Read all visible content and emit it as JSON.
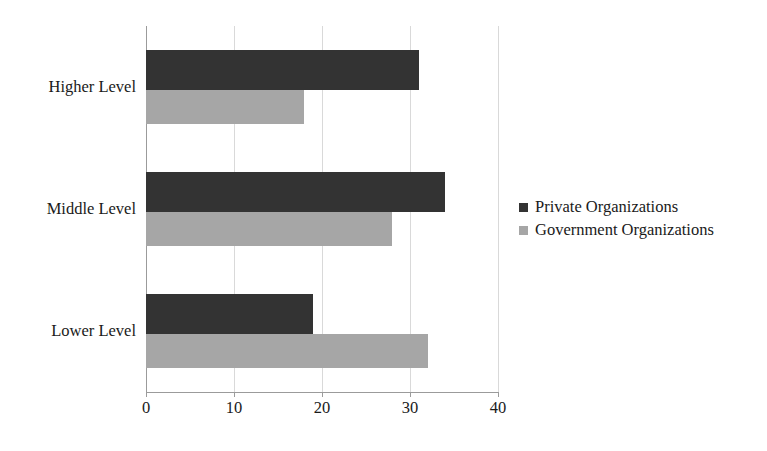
{
  "chart_data": {
    "type": "bar",
    "orientation": "horizontal",
    "title": "",
    "xlabel": "",
    "ylabel": "",
    "xlim": [
      0,
      40
    ],
    "xticks": [
      "0",
      "10",
      "20",
      "30",
      "40"
    ],
    "xtick_values": [
      0,
      10,
      20,
      30,
      40
    ],
    "grid": "vertical",
    "legend_position": "right",
    "categories": [
      "Higher Level",
      "Middle Level",
      "Lower Level"
    ],
    "series": [
      {
        "name": "Private Organizations",
        "color": "#333333",
        "values": [
          31,
          34,
          19
        ]
      },
      {
        "name": "Government Organizations",
        "color": "#a6a6a6",
        "values": [
          18,
          28,
          32
        ]
      }
    ]
  },
  "legend": {
    "items": [
      {
        "label": "Private Organizations",
        "swatch": "legend-swatch-private"
      },
      {
        "label": "Government Organizations",
        "swatch": "legend-swatch-government"
      }
    ]
  },
  "axis": {
    "x_tick_labels": [
      "0",
      "10",
      "20",
      "30",
      "40"
    ],
    "category_labels": [
      "Higher Level",
      "Middle Level",
      "Lower Level"
    ]
  },
  "colors": {
    "private": "#333333",
    "government": "#a6a6a6",
    "gridline": "#d9d9d9",
    "axis": "#9b9b9b",
    "text": "#1a1a1a",
    "background": "#ffffff"
  }
}
